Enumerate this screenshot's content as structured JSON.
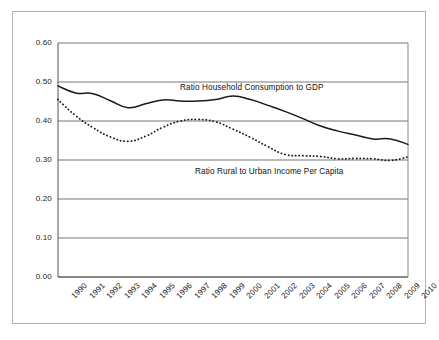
{
  "chart_data": {
    "type": "line",
    "title": "",
    "subtitle": "",
    "xlabel": "",
    "ylabel": "",
    "grid": true,
    "legend_position": "inline-annotation",
    "xlim": [
      1990,
      2010
    ],
    "ylim": [
      0.0,
      0.6
    ],
    "ytick_labels": [
      "0.60",
      "0.50",
      "0.40",
      "0.30",
      "0.20",
      "0.10",
      "0.00"
    ],
    "ytick_values": [
      0.6,
      0.5,
      0.4,
      0.3,
      0.2,
      0.1,
      0.0
    ],
    "categories": [
      "1990",
      "1991",
      "1992",
      "1993",
      "1994",
      "1995",
      "1996",
      "1997",
      "1998",
      "1999",
      "2000",
      "2001",
      "2002",
      "2003",
      "2004",
      "2005",
      "2006",
      "2007",
      "2008",
      "2009",
      "2010"
    ],
    "series": [
      {
        "name": "Ratio Household Consumption to GDP",
        "style": "solid",
        "color": "#1a1a1a",
        "values": [
          0.49,
          0.472,
          0.47,
          0.452,
          0.434,
          0.444,
          0.454,
          0.451,
          0.451,
          0.455,
          0.464,
          0.455,
          0.44,
          0.424,
          0.406,
          0.387,
          0.374,
          0.364,
          0.354,
          0.354,
          0.34
        ]
      },
      {
        "name": "Ratio Rural to Urban Income Per Capita",
        "style": "dotted",
        "color": "#1a1a1a",
        "values": [
          0.455,
          0.414,
          0.383,
          0.359,
          0.348,
          0.361,
          0.384,
          0.4,
          0.404,
          0.398,
          0.379,
          0.358,
          0.334,
          0.314,
          0.311,
          0.309,
          0.303,
          0.304,
          0.303,
          0.299,
          0.308
        ]
      }
    ],
    "annotations": [
      {
        "text": "Ratio Household Consumption to GDP",
        "x_px": 180,
        "y_px": 83
      },
      {
        "text": "Ratio Rural to Urban Income Per Capita",
        "x_px": 195,
        "y_px": 167
      }
    ]
  }
}
